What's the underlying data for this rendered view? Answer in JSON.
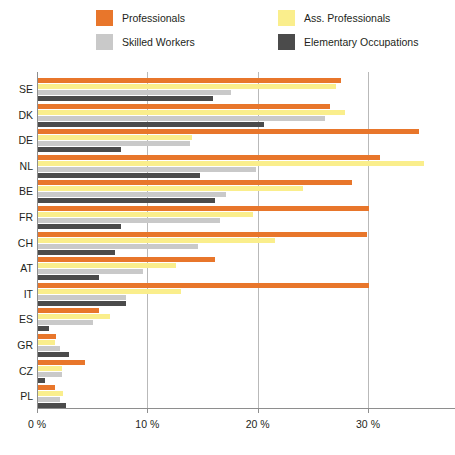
{
  "chart_data": {
    "type": "bar",
    "orientation": "horizontal",
    "title": "",
    "subtitle": "",
    "xlabel": "",
    "ylabel": "",
    "xlim": [
      0,
      35.4
    ],
    "xticks": [
      0,
      10,
      20,
      30
    ],
    "xtick_labels": [
      "0 %",
      "10 %",
      "20 %",
      "30 %"
    ],
    "grid": "vertical",
    "legend_position": "top",
    "categories": [
      "SE",
      "DK",
      "DE",
      "NL",
      "BE",
      "FR",
      "CH",
      "AT",
      "IT",
      "ES",
      "GR",
      "CZ",
      "PL"
    ],
    "series": [
      {
        "name": "Professionals",
        "color": "#E8762B",
        "values": [
          27.5,
          26.5,
          34.5,
          31.0,
          28.5,
          30.0,
          29.8,
          16.0,
          30.0,
          5.5,
          1.6,
          4.3,
          1.5
        ]
      },
      {
        "name": "Ass. Professionals",
        "color": "#FAEE8C",
        "values": [
          27.0,
          27.8,
          14.0,
          35.0,
          24.0,
          19.5,
          21.5,
          12.5,
          13.0,
          6.5,
          1.5,
          2.2,
          2.3
        ]
      },
      {
        "name": "Skilled Workers",
        "color": "#C9C9C9",
        "values": [
          17.5,
          26.0,
          13.8,
          19.8,
          17.0,
          16.5,
          14.5,
          9.5,
          8.0,
          5.0,
          2.0,
          2.2,
          2.0
        ]
      },
      {
        "name": "Elementary Occupations",
        "color": "#4B4B4B",
        "values": [
          15.9,
          20.5,
          7.5,
          14.7,
          16.0,
          7.5,
          7.0,
          5.5,
          8.0,
          1.0,
          2.8,
          0.6,
          2.5
        ]
      }
    ]
  },
  "legend": {
    "items": [
      {
        "label": "Professionals",
        "color": "#E8762B"
      },
      {
        "label": "Ass. Professionals",
        "color": "#FAEE8C"
      },
      {
        "label": "Skilled Workers",
        "color": "#C9C9C9"
      },
      {
        "label": "Elementary Occupations",
        "color": "#4B4B4B"
      }
    ]
  },
  "footnote": ""
}
